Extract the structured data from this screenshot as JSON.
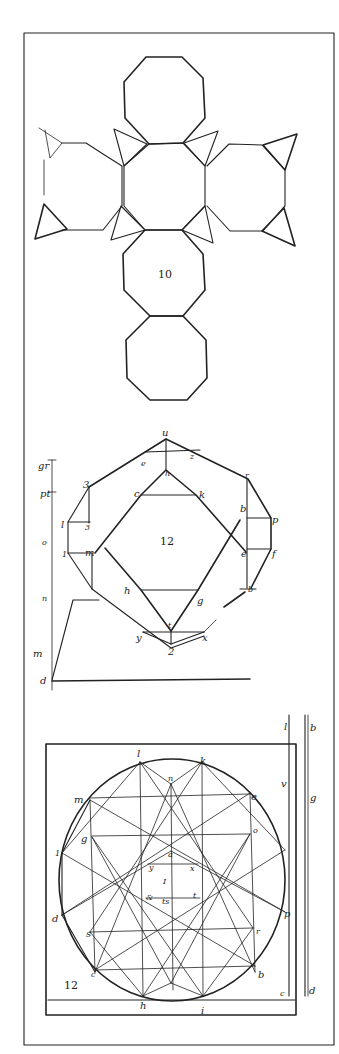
{
  "figure": {
    "background": "#ffffff",
    "ink_color": "#222222",
    "frame": {
      "x": 24,
      "y": 33,
      "w": 310,
      "h": 1012
    }
  },
  "panels": [
    {
      "id": "truncated-cube-net",
      "number_label": "10",
      "description": "Net of truncated cube: six octagons arranged in a cross with triangular faces at corners"
    },
    {
      "id": "dodecagon-construction",
      "number_label": "12",
      "vertex_labels": {
        "u": "u",
        "e_top": "e",
        "z": "z",
        "h_top": "h",
        "c": "c",
        "k": "k",
        "three": "3",
        "r": "r",
        "b_upper": "b",
        "p_right": "p",
        "l": "l",
        "three_inner": "3",
        "m": "m",
        "one": "1",
        "e_right": "e",
        "f": "f",
        "h_bottom": "h",
        "g": "g",
        "b_lower": "b",
        "t": "t",
        "y": "y",
        "x": "x",
        "two": "2"
      },
      "scale_labels": [
        "gr",
        "pt",
        "o",
        "n",
        "m",
        "d"
      ]
    },
    {
      "id": "circle-star-construction",
      "number_label": "12",
      "vertex_labels": {
        "l": "l",
        "k": "k",
        "n": "n",
        "m": "m",
        "e": "e",
        "g": "g",
        "o": "o",
        "one": "1",
        "a": "a",
        "y": "y",
        "x": "x",
        "I": "I",
        "amp": "&",
        "t": "t",
        "ts": "ts",
        "d": "d",
        "s": "s",
        "r": "r",
        "p": "p",
        "c": "c",
        "b": "b",
        "h": "h",
        "i": "i",
        "c_right": "c"
      },
      "side_labels": {
        "col1": [
          "l",
          "v",
          "c"
        ],
        "col2": [
          "b",
          "g",
          "d"
        ]
      }
    }
  ]
}
